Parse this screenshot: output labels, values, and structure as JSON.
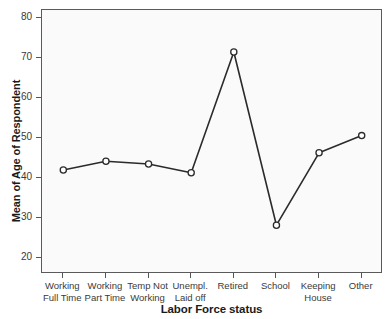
{
  "chart_data": {
    "type": "line",
    "title": "",
    "xlabel": "Labor Force status",
    "ylabel": "Mean of Age of Respondent",
    "categories": [
      "Working Full Time",
      "Working Part Time",
      "Temp Not Working",
      "Unempl. Laid off",
      "Retired",
      "School",
      "Keeping House",
      "Other"
    ],
    "category_lines": [
      [
        "Working",
        "Full Time"
      ],
      [
        "Working",
        "Part Time"
      ],
      [
        "Temp Not",
        "Working"
      ],
      [
        "Unempl.",
        "Laid off"
      ],
      [
        "Retired",
        ""
      ],
      [
        "School",
        ""
      ],
      [
        "Keeping",
        "House"
      ],
      [
        "Other",
        ""
      ]
    ],
    "values": [
      42.0,
      44.2,
      43.5,
      41.3,
      71.5,
      28.2,
      46.3,
      50.6
    ],
    "ylim": [
      16,
      82
    ],
    "yticks": [
      20,
      30,
      40,
      50,
      60,
      70,
      80
    ],
    "ytick_labels": [
      "20",
      "30",
      "40",
      "50",
      "60",
      "70",
      "80"
    ],
    "grid": false,
    "legend": "none",
    "marker": "open-circle",
    "line_color": "#2b2b2b",
    "marker_fill": "#ffffff",
    "plot_background": "#fafafa",
    "frame_color": "#5a5a5a"
  }
}
